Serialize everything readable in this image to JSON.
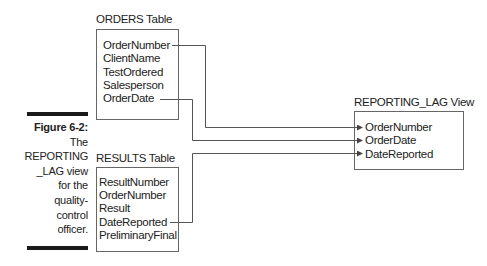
{
  "caption": {
    "figure_label": "Figure 6-2:",
    "lines": [
      "The",
      "REPORTING",
      "_LAG view",
      "for the",
      "quality-",
      "control",
      "officer."
    ]
  },
  "orders_table": {
    "title": "ORDERS Table",
    "fields": [
      "OrderNumber",
      "ClientName",
      "TestOrdered",
      "Salesperson",
      "OrderDate"
    ]
  },
  "results_table": {
    "title": "RESULTS Table",
    "fields": [
      "ResultNumber",
      "OrderNumber",
      "Result",
      "DateReported",
      "PreliminaryFinal"
    ]
  },
  "view": {
    "title": "REPORTING_LAG View",
    "fields": [
      "OrderNumber",
      "OrderDate",
      "DateReported"
    ]
  },
  "connections": [
    {
      "from": "ORDERS.OrderNumber",
      "to": "REPORTING_LAG.OrderNumber"
    },
    {
      "from": "ORDERS.OrderDate",
      "to": "REPORTING_LAG.OrderDate"
    },
    {
      "from": "RESULTS.DateReported",
      "to": "REPORTING_LAG.DateReported"
    }
  ],
  "colors": {
    "line": "#555555",
    "box_border": "#666666",
    "bar": "#1a1a1a",
    "text": "#222222"
  }
}
